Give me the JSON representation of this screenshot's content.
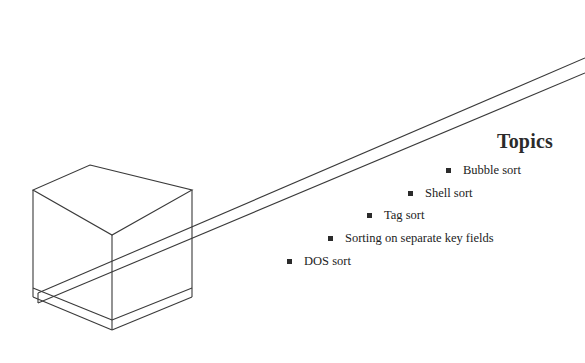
{
  "slide": {
    "background_color": "#ffffff",
    "line_color": "#3a3a3a",
    "text_color": "#222222",
    "title": "Topics",
    "topics": [
      {
        "label": "Bubble sort",
        "bullet": "filled-square-bullet"
      },
      {
        "label": "Shell sort",
        "bullet": "filled-square-bullet"
      },
      {
        "label": "Tag sort",
        "bullet": "filled-square-bullet"
      },
      {
        "label": "Sorting on separate key fields",
        "bullet": "filled-square-bullet"
      },
      {
        "label": "DOS sort",
        "bullet": "filled-square-bullet"
      }
    ],
    "graphic": {
      "name": "isometric-cube-on-ramp",
      "description": "Wireframe isometric cube resting on a thin inclined plank rising to the upper right"
    }
  }
}
